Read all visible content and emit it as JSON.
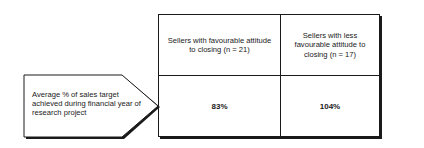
{
  "row_label": "Average % of sales target achieved during financial year of research project",
  "columns": [
    {
      "header": "Sellers with favourable attitude to closing (n = 21)",
      "value": "83%"
    },
    {
      "header": "Sellers with less favourable attitude to closing (n = 17)",
      "value": "104%"
    }
  ],
  "colors": {
    "line": "#1a1a1a",
    "background": "#ffffff"
  }
}
